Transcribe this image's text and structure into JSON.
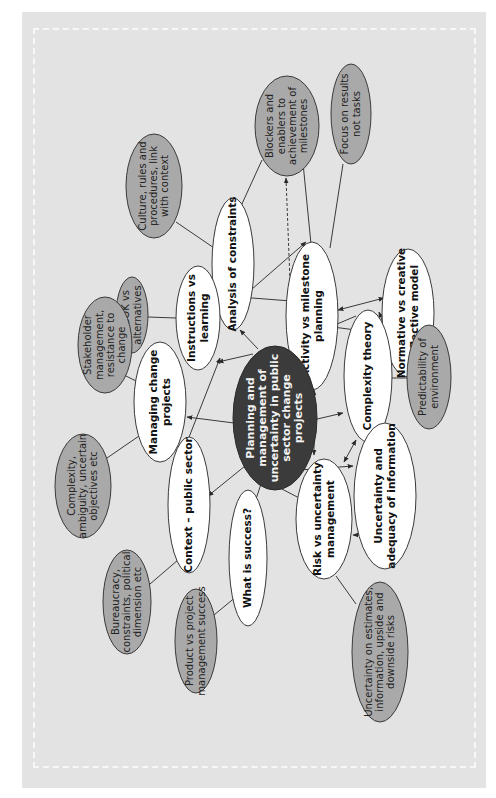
{
  "figure": {
    "orientation": "rotated -90deg (text reads bottom-to-top)",
    "colors": {
      "panel": "#e3e3e3",
      "border_dash": "#f7f7f7",
      "central_node": "#3b3b3b",
      "concept_node": "#ffffff",
      "detail_node": "#a9a9a9",
      "line": "#3a3a3a"
    }
  },
  "nodes": {
    "central": {
      "lines": [
        "Planning and",
        "management of",
        "uncertainty in public",
        "sector change",
        "projects"
      ]
    },
    "culture": {
      "lines": [
        "Culture, rules and",
        "procedures, link",
        "with context"
      ]
    },
    "blockers": {
      "lines": [
        "Blockers and",
        "enablers to",
        "achievement of",
        "milestones"
      ]
    },
    "focus": {
      "lines": [
        "Focus on results",
        "not tasks"
      ]
    },
    "analysis": {
      "lines": [
        "Analysis of constraints"
      ]
    },
    "activity": {
      "lines": [
        "Activity vs milestone",
        "planning"
      ]
    },
    "normative": {
      "lines": [
        "Normative vs creative",
        "reflective model"
      ]
    },
    "instructions": {
      "lines": [
        "Instructions vs",
        "learning"
      ]
    },
    "pmbok": {
      "lines": [
        "PMBOK vs",
        "alternatives"
      ]
    },
    "stakeholder": {
      "lines": [
        "Stakeholder",
        "management,",
        "resistance to",
        "change"
      ]
    },
    "managing": {
      "lines": [
        "Managing change",
        "projects"
      ]
    },
    "complexity_theory": {
      "lines": [
        "Complexity theory"
      ]
    },
    "predictability": {
      "lines": [
        "Predictability of",
        "environment"
      ]
    },
    "complexity_ambiguity": {
      "lines": [
        "Complexity,",
        "ambiguity, uncertain",
        "objectives etc"
      ]
    },
    "context": {
      "lines": [
        "Context – public sector"
      ]
    },
    "bureaucracy": {
      "lines": [
        "Bureaucracy,",
        "constraints, political",
        "dimension etc"
      ]
    },
    "success": {
      "lines": [
        "What is success?"
      ]
    },
    "product": {
      "lines": [
        "Product vs project",
        "management success"
      ]
    },
    "risk": {
      "lines": [
        "Risk vs uncertainty",
        "management"
      ]
    },
    "uncertainty_info": {
      "lines": [
        "Uncertainty and",
        "adequacy of information"
      ]
    },
    "uncertainty_estimates": {
      "lines": [
        "Uncertainty on estimates,",
        "information, upside and",
        "downside risks"
      ]
    }
  }
}
